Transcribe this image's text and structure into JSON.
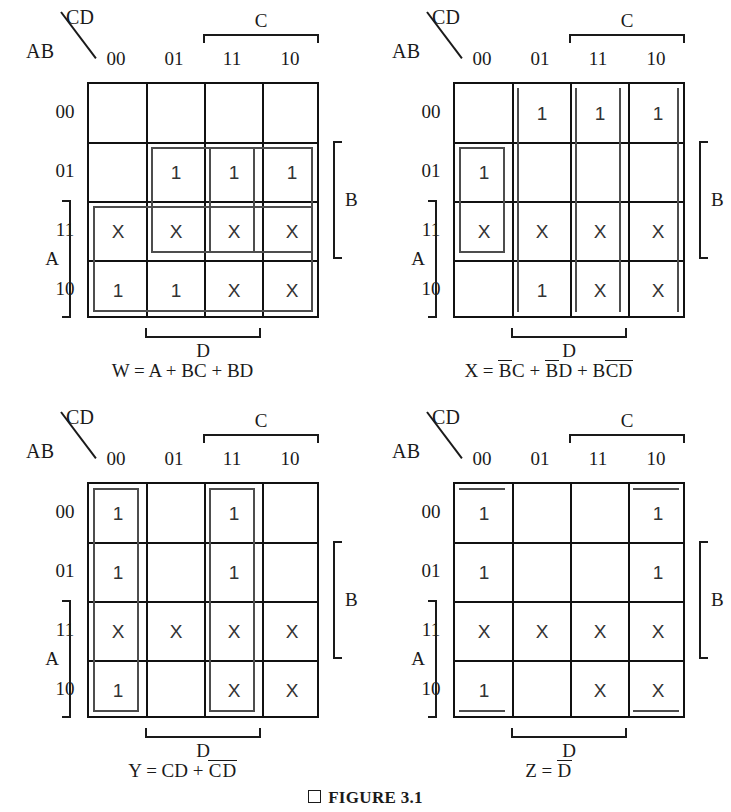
{
  "figure": {
    "caption": "FIGURE 3.1",
    "caption_marker_icon": "square-bullet-icon"
  },
  "axis_labels": {
    "corner_top": "CD",
    "corner_bottom": "AB",
    "col_headers": [
      "00",
      "01",
      "11",
      "10"
    ],
    "row_headers": [
      "00",
      "01",
      "11",
      "10"
    ],
    "bracket_c": "C",
    "bracket_d": "D",
    "bracket_b": "B",
    "bracket_a": "A"
  },
  "colors": {
    "grid_line": "#111111",
    "group_outline": "#4d4d4d",
    "text": "#1a1a1a"
  },
  "maps": [
    {
      "id": "kmap-w",
      "output": "W",
      "equation_plain": "W = A + BC + BD",
      "equation_parts": [
        {
          "text": "W = A + BC + BD",
          "overbar": false
        }
      ],
      "cells": [
        [
          "",
          "",
          "",
          ""
        ],
        [
          "",
          "1",
          "1",
          "1"
        ],
        [
          "X",
          "X",
          "X",
          "X"
        ],
        [
          "1",
          "1",
          "X",
          "X"
        ]
      ],
      "groups": [
        {
          "name": "group-bc",
          "term": "BC",
          "cols": [
            2,
            3
          ],
          "rows": [
            1,
            2
          ]
        },
        {
          "name": "group-bd",
          "term": "BD",
          "cols": [
            1,
            2
          ],
          "rows": [
            1,
            2
          ]
        },
        {
          "name": "group-a",
          "term": "A",
          "cols": [
            0,
            3
          ],
          "rows": [
            2,
            3
          ]
        }
      ]
    },
    {
      "id": "kmap-x",
      "output": "X",
      "equation_plain": "X = B'C + B'D + BC'D'",
      "equation_parts": [
        {
          "text": "X = ",
          "overbar": false
        },
        {
          "text": "B",
          "overbar": true
        },
        {
          "text": "C + ",
          "overbar": false
        },
        {
          "text": "B",
          "overbar": true
        },
        {
          "text": "D + B",
          "overbar": false
        },
        {
          "text": "CD",
          "overbar": true
        }
      ],
      "cells": [
        [
          "",
          "1",
          "1",
          "1"
        ],
        [
          "1",
          "",
          "",
          ""
        ],
        [
          "X",
          "X",
          "X",
          "X"
        ],
        [
          "",
          "1",
          "X",
          "X"
        ]
      ],
      "groups": [
        {
          "name": "group-notb-c",
          "term": "B'C",
          "cols": [
            2,
            3
          ],
          "rows": [
            0,
            3
          ],
          "wrap": "vertical"
        },
        {
          "name": "group-notb-d",
          "term": "B'D",
          "cols": [
            1,
            2
          ],
          "rows": [
            0,
            3
          ],
          "wrap": "vertical"
        },
        {
          "name": "group-b-notc-notd",
          "term": "BC'D'",
          "cols": [
            0,
            0
          ],
          "rows": [
            1,
            2
          ]
        }
      ]
    },
    {
      "id": "kmap-y",
      "output": "Y",
      "equation_plain": "Y = CD + C'D'",
      "equation_parts": [
        {
          "text": "Y = CD + ",
          "overbar": false
        },
        {
          "text": "C",
          "overbar": true
        },
        {
          "text": "D",
          "overbar": true
        }
      ],
      "cells": [
        [
          "1",
          "",
          "1",
          ""
        ],
        [
          "1",
          "",
          "1",
          ""
        ],
        [
          "X",
          "X",
          "X",
          "X"
        ],
        [
          "1",
          "",
          "X",
          "X"
        ]
      ],
      "groups": [
        {
          "name": "group-notc-notd",
          "term": "C'D'",
          "cols": [
            0,
            0
          ],
          "rows": [
            0,
            3
          ]
        },
        {
          "name": "group-cd",
          "term": "CD",
          "cols": [
            2,
            2
          ],
          "rows": [
            0,
            3
          ]
        }
      ]
    },
    {
      "id": "kmap-z",
      "output": "Z",
      "equation_plain": "Z = D'",
      "equation_parts": [
        {
          "text": "Z = ",
          "overbar": false
        },
        {
          "text": "D",
          "overbar": true
        }
      ],
      "cells": [
        [
          "1",
          "",
          "",
          "1"
        ],
        [
          "1",
          "",
          "",
          "1"
        ],
        [
          "X",
          "X",
          "X",
          "X"
        ],
        [
          "1",
          "",
          "X",
          "X"
        ]
      ],
      "groups": [
        {
          "name": "group-notd-left",
          "term": "D'",
          "cols": [
            0,
            0
          ],
          "rows": [
            0,
            3
          ],
          "wrap": "horizontal"
        },
        {
          "name": "group-notd-right",
          "term": "D'",
          "cols": [
            3,
            3
          ],
          "rows": [
            0,
            3
          ],
          "wrap": "horizontal"
        }
      ]
    }
  ]
}
